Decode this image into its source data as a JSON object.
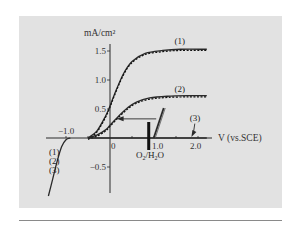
{
  "chart_data": {
    "type": "line",
    "title": "",
    "xlabel": "V (vs.SCE)",
    "ylabel": "mA/cm²",
    "x_ticks": [
      -1.0,
      0,
      1.0,
      2.0
    ],
    "x_tick_labels": [
      "-1.0",
      "0",
      "1.0",
      "2.0"
    ],
    "y_ticks": [
      1.5,
      1.0,
      0.5,
      -0.5
    ],
    "y_tick_labels": [
      "1.5",
      "1.0",
      "0.5",
      "-0.5"
    ],
    "xlim": [
      -1.5,
      2.3
    ],
    "ylim": [
      -1.0,
      1.7
    ],
    "grid": false,
    "series": [
      {
        "name": "(1)",
        "style": "solid+dashed",
        "x": [
          -0.5,
          -0.3,
          -0.1,
          0.0,
          0.1,
          0.3,
          0.5,
          0.8,
          1.2,
          1.6,
          2.2
        ],
        "y": [
          0.0,
          0.12,
          0.38,
          0.55,
          0.75,
          1.1,
          1.32,
          1.46,
          1.51,
          1.53,
          1.53
        ]
      },
      {
        "name": "(2)",
        "style": "solid+dashed",
        "x": [
          -0.5,
          -0.3,
          -0.1,
          0.0,
          0.2,
          0.4,
          0.6,
          0.9,
          1.3,
          1.8,
          2.2
        ],
        "y": [
          0.0,
          0.05,
          0.14,
          0.22,
          0.38,
          0.52,
          0.62,
          0.69,
          0.72,
          0.73,
          0.73
        ]
      },
      {
        "name": "(1)(2)(3) cathodic",
        "style": "solid",
        "x": [
          -0.9,
          -1.0,
          -1.1,
          -1.2,
          -1.3,
          -1.4
        ],
        "y": [
          0.0,
          -0.03,
          -0.15,
          -0.4,
          -0.7,
          -1.0
        ]
      },
      {
        "name": "(3)",
        "style": "solid",
        "x": [
          -0.5,
          2.2
        ],
        "y": [
          0.0,
          0.0
        ]
      }
    ],
    "annotations": [
      {
        "text": "(1)",
        "x": 1.6,
        "y": 1.62
      },
      {
        "text": "(2)",
        "x": 1.6,
        "y": 0.8
      },
      {
        "text": "(3)",
        "x": 1.95,
        "y": 0.3,
        "arrow_to": [
          1.85,
          0.0
        ]
      },
      {
        "text": "(1)",
        "x": -1.25,
        "y": -0.3
      },
      {
        "text": "(2)",
        "x": -1.25,
        "y": -0.45
      },
      {
        "text": "(3)",
        "x": -1.25,
        "y": -0.6
      },
      {
        "text": "O₂/H₂O",
        "x": 0.75,
        "y": -0.35,
        "marker_bar_x": 0.88
      },
      {
        "text": "arrow",
        "from": [
          1.05,
          0.33
        ],
        "to": [
          0.15,
          0.33
        ]
      }
    ]
  }
}
